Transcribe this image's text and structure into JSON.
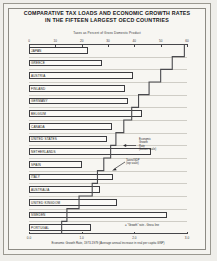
{
  "header": {
    "title_line1": "COMPARATIVE TAX LOADS AND ECONOMIC GROWTH RATES",
    "title_line2": "IN THE FIFTEEN LARGEST OECD COUNTRIES",
    "subtitle": "Taxes as Percent of Gross Domestic Product"
  },
  "annotations": {
    "growth": "Economic\nGrowth\nRate\n(bottom scale)",
    "taxes": "Taxes/GDP\n(top scale)",
    "legend": "= \"Growth\" rate - Gross line"
  },
  "chart_data": {
    "type": "bar",
    "title": "COMPARATIVE TAX LOADS AND ECONOMIC GROWTH RATES IN THE FIFTEEN LARGEST OECD COUNTRIES",
    "subtitle": "Taxes as Percent of Gross Domestic Product",
    "xlabel_top": "Taxes as Percent of Gross Domestic Product",
    "xlabel_bottom": "Economic Growth Rate, 1973-1979 (Average annual increase in real per capita GNP)",
    "ylabel": "",
    "grid": true,
    "legend_position": "bottom-right",
    "xlim_top": [
      0,
      60
    ],
    "xticks_top": [
      "0",
      "10",
      "20",
      "30",
      "40",
      "50",
      "60"
    ],
    "xtick_values_top": [
      0,
      10,
      20,
      30,
      40,
      50,
      60
    ],
    "xlim_bottom": [
      0.0,
      3.0
    ],
    "xticks_bottom": [
      "0.0",
      "1.0",
      "2.0",
      "3.0"
    ],
    "xtick_values_bottom": [
      0.0,
      1.0,
      2.0,
      3.0
    ],
    "categories": [
      "JAPAN",
      "GREECE",
      "AUSTRIA",
      "FINLAND",
      "GERMANY",
      "BELGIUM",
      "CANADA",
      "UNITED STATES",
      "NETHERLANDS",
      "SPAIN",
      "ITALY",
      "AUSTRALIA",
      "UNITED KINGDOM",
      "SWEDEN",
      "PORTUGAL"
    ],
    "series": [
      {
        "name": "Taxes/GDP (top scale)",
        "axis": "top",
        "type": "bar",
        "values": [
          22.5,
          27.8,
          39.5,
          36.5,
          37.5,
          43.0,
          31.5,
          29.5,
          46.5,
          20.0,
          32.0,
          27.0,
          33.5,
          52.5,
          23.5
        ]
      },
      {
        "name": "Economic Growth Rate (bottom scale)",
        "axis": "bottom",
        "type": "step-line",
        "values": [
          2.95,
          2.72,
          2.5,
          2.28,
          2.08,
          1.95,
          1.8,
          1.65,
          1.55,
          1.42,
          1.3,
          1.2,
          0.95,
          0.72,
          0.62
        ]
      }
    ]
  }
}
